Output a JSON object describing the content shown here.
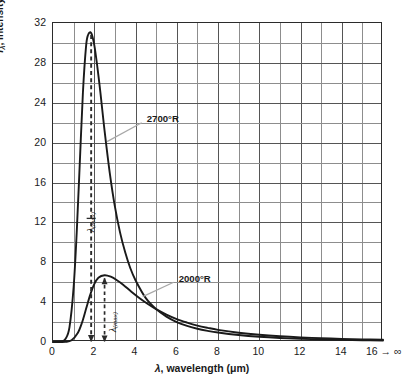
{
  "chart_data": {
    "type": "line",
    "title": "",
    "xlabel": "λ, wavelength (μm)",
    "ylabel": "Iλ, Intensity of monochromatic emission (Btu/hr · ft² · μm)",
    "ylabel_line1": "Iλ, Intensity of monochromatic emission",
    "ylabel_line2": "(Btu/hr · ft² · μm)",
    "xlim": [
      0,
      16
    ],
    "ylim": [
      0,
      32
    ],
    "x_ticks": [
      0,
      2,
      4,
      6,
      8,
      10,
      12,
      14,
      16
    ],
    "x_tick_labels": [
      "0",
      "2",
      "4",
      "6",
      "8",
      "10",
      "12",
      "14",
      "16 → ∞"
    ],
    "y_ticks": [
      0,
      4,
      8,
      12,
      16,
      20,
      24,
      28,
      32
    ],
    "y_tick_labels": [
      "0",
      "4",
      "8",
      "12",
      "16",
      "20",
      "24",
      "28",
      "32"
    ],
    "x_minor_step": 1,
    "y_minor_step": 2,
    "grid": true,
    "legend": "none",
    "series": [
      {
        "name": "2700°R",
        "label": "2700°R",
        "color": "#1a1a1a",
        "peak_x": 1.85,
        "peak_y": 31.0,
        "lambda_max_label": "λ(max)",
        "x": [
          0.0,
          0.4,
          0.6,
          0.8,
          1.0,
          1.15,
          1.3,
          1.45,
          1.6,
          1.7,
          1.85,
          2.0,
          2.15,
          2.3,
          2.5,
          2.75,
          3.0,
          3.25,
          3.5,
          3.75,
          4.0,
          4.5,
          5.0,
          5.5,
          6.0,
          6.5,
          7.0,
          7.5,
          8.0,
          9.0,
          10.0,
          11.0,
          12.0,
          13.0,
          14.0,
          15.0,
          16.0
        ],
        "y": [
          0.0,
          0.05,
          0.3,
          1.5,
          5.5,
          11.0,
          18.0,
          25.0,
          29.6,
          30.8,
          31.0,
          29.8,
          27.6,
          25.0,
          21.2,
          17.0,
          13.6,
          11.0,
          9.0,
          7.4,
          6.2,
          4.4,
          3.3,
          2.55,
          2.0,
          1.62,
          1.33,
          1.12,
          0.95,
          0.7,
          0.52,
          0.4,
          0.32,
          0.26,
          0.21,
          0.18,
          0.15
        ]
      },
      {
        "name": "2000°R",
        "label": "2000°R",
        "color": "#1a1a1a",
        "peak_x": 2.5,
        "peak_y": 6.7,
        "lambda_max_label": "λ(max)",
        "x": [
          0.0,
          0.6,
          0.9,
          1.2,
          1.4,
          1.6,
          1.8,
          2.0,
          2.2,
          2.5,
          2.8,
          3.1,
          3.4,
          3.8,
          4.2,
          4.6,
          5.0,
          5.5,
          6.0,
          6.5,
          7.0,
          7.5,
          8.0,
          9.0,
          10.0,
          11.0,
          12.0,
          13.0,
          14.0,
          15.0,
          16.0
        ],
        "y": [
          0.0,
          0.02,
          0.18,
          0.9,
          1.9,
          3.3,
          4.7,
          5.8,
          6.45,
          6.7,
          6.55,
          6.2,
          5.75,
          5.05,
          4.4,
          3.82,
          3.3,
          2.75,
          2.3,
          1.95,
          1.65,
          1.42,
          1.22,
          0.93,
          0.72,
          0.57,
          0.46,
          0.38,
          0.31,
          0.26,
          0.22
        ]
      }
    ],
    "annotations": [
      {
        "name": "lambda-max-2700",
        "type": "dashed-vline",
        "x": 1.85,
        "from_y": 0,
        "to_y": 31.0,
        "label": "λ(max)"
      },
      {
        "name": "lambda-max-2000",
        "type": "dashed-vline",
        "x": 2.5,
        "from_y": 0,
        "to_y": 6.7,
        "label": "λ(max)"
      },
      {
        "name": "callout-2700",
        "type": "leader-label",
        "text": "2700°R",
        "anchor_x": 2.62,
        "anchor_y": 20.1
      },
      {
        "name": "callout-2000",
        "type": "leader-label",
        "text": "2000°R",
        "anchor_x": 4.35,
        "anchor_y": 4.55
      }
    ]
  },
  "colors": {
    "curve": "#1a1a1a",
    "grid_minor": "#8d8d8d",
    "grid_major": "#555555",
    "frame": "#2b2b2b",
    "leader": "#a8a8a8",
    "background": "#ffffff"
  }
}
